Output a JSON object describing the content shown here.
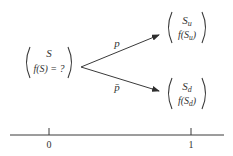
{
  "diagram": {
    "type": "binomial-tree-one-step",
    "root": {
      "line1": "S",
      "line2": "f(S) = ?"
    },
    "up_node": {
      "line1": "S",
      "line1_sub": "u",
      "line2_prefix": "f(S",
      "line2_sub": "u",
      "line2_suffix": ")"
    },
    "down_node": {
      "line1": "S",
      "line1_sub": "d",
      "line2_prefix": "f(S",
      "line2_sub": "d",
      "line2_suffix": ")"
    },
    "edges": [
      {
        "from": "root",
        "to": "up_node",
        "label": "p"
      },
      {
        "from": "root",
        "to": "down_node",
        "label": "p̄"
      }
    ],
    "time_axis": {
      "ticks": [
        {
          "label": "0"
        },
        {
          "label": "1"
        }
      ]
    },
    "colors": {
      "ink": "#333333",
      "background": "#ffffff"
    }
  }
}
